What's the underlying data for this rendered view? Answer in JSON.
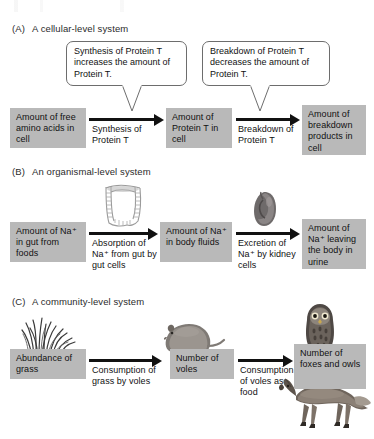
{
  "figure": {
    "sections": [
      {
        "label": "(A)",
        "title": "A cellular-level system",
        "boxes": [
          "Amount of free amino acids in cell",
          "Amount of Protein T in cell",
          "Amount of breakdown products in cell"
        ],
        "arrows": [
          "Synthesis of Protein T",
          "Breakdown of Protein T"
        ],
        "callouts": [
          "Synthesis of Protein T increases the amount of Protein T.",
          "Breakdown of Protein T decreases the amount of Protein T."
        ],
        "art": []
      },
      {
        "label": "(B)",
        "title": "An organismal-level system",
        "boxes": [
          "Amount of Na⁺ in gut from foods",
          "Amount of Na⁺ in body fluids",
          "Amount of Na⁺ leaving the body in urine"
        ],
        "arrows": [
          "Absorption of Na⁺ from gut by gut cells",
          "Excretion of Na⁺ by kidney cells"
        ],
        "callouts": [],
        "art": [
          "intestine-illustration",
          "kidney-illustration"
        ]
      },
      {
        "label": "(C)",
        "title": "A community-level system",
        "boxes": [
          "Abundance of grass",
          "Number of voles",
          "Number of foxes and owls"
        ],
        "arrows": [
          "Consumption of grass by voles",
          "Consumption of voles as food"
        ],
        "callouts": [],
        "art": [
          "grass-illustration",
          "vole-illustration",
          "owl-illustration",
          "fox-illustration"
        ]
      }
    ],
    "colors": {
      "box_fill": "#b9b9b9",
      "arrow": "#111111",
      "callout_border": "#6d6d6d",
      "page_background": "#ffffff"
    }
  }
}
